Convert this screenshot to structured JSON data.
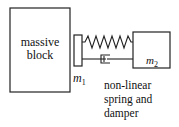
{
  "diagram": {
    "massive_block": {
      "label_line1": "massive",
      "label_line2": "block"
    },
    "mass1": {
      "symbol": "m",
      "subscript": "1"
    },
    "mass2": {
      "symbol": "m",
      "subscript": "2"
    },
    "connector_note": {
      "line1": "non-linear",
      "line2": "spring and",
      "line3": "damper"
    },
    "colors": {
      "stroke": "#222222",
      "background": "#ffffff"
    }
  }
}
